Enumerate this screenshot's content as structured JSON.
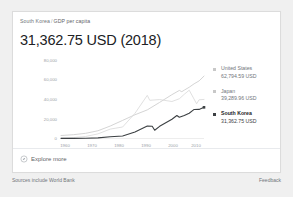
{
  "card": {
    "breadcrumb": {
      "region": "South Korea",
      "separator": "/",
      "metric": "GDP per capita"
    },
    "headline": "31,362.75 USD (2018)",
    "explore": {
      "label": "Explore more",
      "icon": "explore-compass-icon"
    }
  },
  "legend": [
    {
      "name": "United States",
      "value": "62,794.59 USD",
      "color": "#c8c8c8",
      "active": false
    },
    {
      "name": "Japan",
      "value": "39,289.96 USD",
      "color": "#c8c8c8",
      "active": false
    },
    {
      "name": "South Korea",
      "value": "31,362.75 USD",
      "color": "#3c4043",
      "active": true
    }
  ],
  "footer": {
    "source": "Sources include World Bank",
    "feedback": "Feedback"
  },
  "chart_data": {
    "type": "line",
    "title": "GDP per capita",
    "xlabel": "",
    "ylabel": "",
    "grid": false,
    "legend_position": "right",
    "xlim": [
      1960,
      2018
    ],
    "ylim": [
      0,
      80000
    ],
    "xticks": [
      "1960",
      "1970",
      "1980",
      "1990",
      "2000",
      "2010"
    ],
    "xtick_values": [
      1960,
      1970,
      1980,
      1990,
      2000,
      2010
    ],
    "yticks": [
      "80,000",
      "60,000",
      "40,000",
      "20,000",
      "0"
    ],
    "ytick_values": [
      80000,
      60000,
      40000,
      20000,
      0
    ],
    "series": [
      {
        "name": "United States",
        "color": "#cfcfcf",
        "end_value": 62794.59,
        "x": [
          1960,
          1965,
          1970,
          1975,
          1980,
          1985,
          1990,
          1995,
          2000,
          2005,
          2008,
          2009,
          2010,
          2012,
          2014,
          2016,
          2018
        ],
        "values": [
          3007,
          3828,
          5234,
          7801,
          12575,
          18237,
          23889,
          28782,
          36330,
          44123,
          48383,
          47100,
          48651,
          51603,
          55050,
          57928,
          62794.59
        ]
      },
      {
        "name": "Japan",
        "color": "#dcdcdc",
        "end_value": 39289.96,
        "x": [
          1960,
          1965,
          1970,
          1975,
          1980,
          1985,
          1990,
          1995,
          1996,
          2000,
          2005,
          2008,
          2010,
          2012,
          2015,
          2016,
          2018
        ],
        "values": [
          479,
          920,
          2038,
          4659,
          9465,
          11585,
          25371,
          43440,
          38437,
          39173,
          37218,
          39992,
          44508,
          48603,
          34961,
          38972,
          39289.96
        ]
      },
      {
        "name": "South Korea",
        "color": "#3c4043",
        "end_value": 31362.75,
        "x": [
          1960,
          1965,
          1970,
          1975,
          1980,
          1985,
          1990,
          1995,
          1997,
          1998,
          2000,
          2005,
          2007,
          2008,
          2010,
          2012,
          2014,
          2016,
          2018
        ],
        "values": [
          158,
          109,
          279,
          617,
          1715,
          2482,
          6610,
          12565,
          12398,
          8282,
          12257,
          19403,
          23101,
          21350,
          23087,
          25467,
          29250,
          29289,
          31362.75
        ]
      }
    ]
  }
}
